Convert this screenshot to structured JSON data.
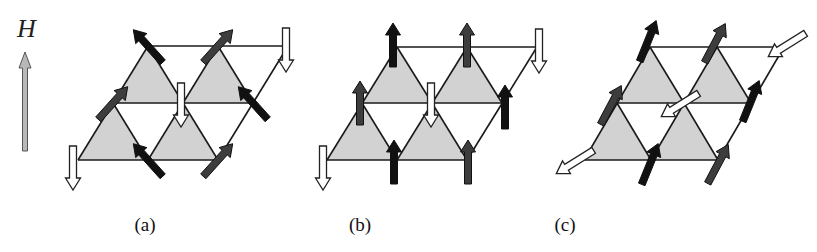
{
  "figure": {
    "field": {
      "label": "H",
      "arrow": {
        "x": 25,
        "y_tail": 151,
        "y_tip": 52,
        "fill": "#b8b8b8",
        "stroke": "#555555"
      }
    },
    "colors": {
      "triangle_fill": "#d2d2d2",
      "edge": "#1a1a1a",
      "spin_black": "#111111",
      "spin_darkgray": "#3d3d3d",
      "spin_white": "#ffffff"
    },
    "panels": [
      {
        "id": "a",
        "label": "(a)",
        "label_x": 145,
        "lattice": {
          "rows": [
            {
              "y": 160,
              "x": [
                78,
                148,
                218
              ]
            },
            {
              "y": 103,
              "x": [
                113,
                183,
                253
              ]
            },
            {
              "y": 46,
              "x": [
                148,
                218,
                288
              ]
            }
          ]
        },
        "spins": [
          {
            "row": 2,
            "col": 0,
            "angle": -132,
            "color": "black",
            "dx": 0,
            "dy": 0
          },
          {
            "row": 2,
            "col": 1,
            "angle": -48,
            "color": "darkgray",
            "dx": 0,
            "dy": 0
          },
          {
            "row": 2,
            "col": 2,
            "angle": 90,
            "color": "white",
            "dx": -2,
            "dy": 4
          },
          {
            "row": 1,
            "col": 0,
            "angle": -48,
            "color": "darkgray",
            "dx": 0,
            "dy": 0
          },
          {
            "row": 1,
            "col": 1,
            "angle": 90,
            "color": "white",
            "dx": -2,
            "dy": 2
          },
          {
            "row": 1,
            "col": 2,
            "angle": -132,
            "color": "black",
            "dx": 0,
            "dy": 0
          },
          {
            "row": 0,
            "col": 0,
            "angle": 90,
            "color": "white",
            "dx": -5,
            "dy": 8
          },
          {
            "row": 0,
            "col": 1,
            "angle": -132,
            "color": "black",
            "dx": 0,
            "dy": 0
          },
          {
            "row": 0,
            "col": 2,
            "angle": -48,
            "color": "darkgray",
            "dx": 0,
            "dy": 0
          }
        ]
      },
      {
        "id": "b",
        "label": "(b)",
        "label_x": 360,
        "lattice": {
          "rows": [
            {
              "y": 160,
              "x": [
                327,
                397,
                467
              ]
            },
            {
              "y": 103,
              "x": [
                362,
                432,
                502
              ]
            },
            {
              "y": 47,
              "x": [
                397,
                467,
                537
              ]
            }
          ]
        },
        "spins": [
          {
            "row": 2,
            "col": 0,
            "angle": -90,
            "color": "black",
            "dx": -4,
            "dy": -2
          },
          {
            "row": 2,
            "col": 1,
            "angle": -90,
            "color": "darkgray",
            "dx": 0,
            "dy": -2
          },
          {
            "row": 2,
            "col": 2,
            "angle": 90,
            "color": "white",
            "dx": 2,
            "dy": 4
          },
          {
            "row": 1,
            "col": 0,
            "angle": -90,
            "color": "darkgray",
            "dx": -2,
            "dy": 0
          },
          {
            "row": 1,
            "col": 1,
            "angle": 90,
            "color": "white",
            "dx": -1,
            "dy": 2
          },
          {
            "row": 1,
            "col": 2,
            "angle": -90,
            "color": "black",
            "dx": 3,
            "dy": 4
          },
          {
            "row": 0,
            "col": 0,
            "angle": 90,
            "color": "white",
            "dx": -4,
            "dy": 8
          },
          {
            "row": 0,
            "col": 1,
            "angle": -90,
            "color": "black",
            "dx": -3,
            "dy": 2
          },
          {
            "row": 0,
            "col": 2,
            "angle": -90,
            "color": "darkgray",
            "dx": 1,
            "dy": 2
          }
        ]
      },
      {
        "id": "c",
        "label": "(c)",
        "label_x": 565,
        "lattice": {
          "rows": [
            {
              "y": 160,
              "x": [
                584,
                651,
                718
              ]
            },
            {
              "y": 103,
              "x": [
                617,
                684,
                751
              ]
            },
            {
              "y": 47,
              "x": [
                650,
                717,
                784
              ]
            }
          ]
        },
        "spins": [
          {
            "row": 2,
            "col": 0,
            "angle": -68,
            "color": "black",
            "dx": -2,
            "dy": -6
          },
          {
            "row": 2,
            "col": 1,
            "angle": -62,
            "color": "darkgray",
            "dx": -2,
            "dy": -4
          },
          {
            "row": 2,
            "col": 2,
            "angle": 148,
            "color": "white",
            "dx": 3,
            "dy": -2
          },
          {
            "row": 1,
            "col": 0,
            "angle": -62,
            "color": "darkgray",
            "dx": -6,
            "dy": 2
          },
          {
            "row": 1,
            "col": 1,
            "angle": 148,
            "color": "white",
            "dx": -4,
            "dy": 2
          },
          {
            "row": 1,
            "col": 2,
            "angle": -68,
            "color": "black",
            "dx": 0,
            "dy": -2
          },
          {
            "row": 0,
            "col": 0,
            "angle": 148,
            "color": "white",
            "dx": -9,
            "dy": 2
          },
          {
            "row": 0,
            "col": 1,
            "angle": -68,
            "color": "black",
            "dx": -1,
            "dy": 4
          },
          {
            "row": 0,
            "col": 2,
            "angle": -62,
            "color": "darkgray",
            "dx": 0,
            "dy": 4
          }
        ]
      }
    ],
    "spin_arrow": {
      "length": 44,
      "shaft_width": 7,
      "head_width": 15,
      "head_length": 12
    }
  }
}
